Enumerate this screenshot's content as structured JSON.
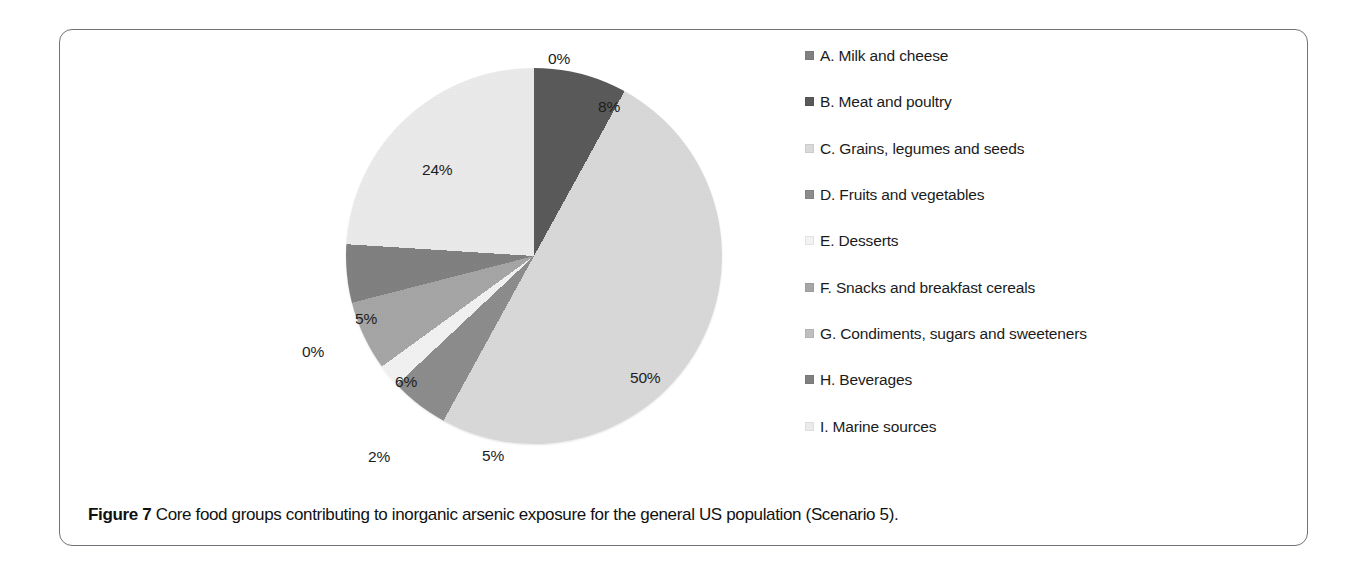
{
  "figure": {
    "caption_label": "Figure 7",
    "caption_text": "Core food groups contributing to inorganic arsenic exposure for the general US population (Scenario 5)."
  },
  "chart_data": {
    "type": "pie",
    "title": "",
    "legend_position": "right",
    "units": "percent",
    "categories": [
      "A. Milk and cheese",
      "B. Meat and poultry",
      "C. Grains, legumes and seeds",
      "D. Fruits and vegetables",
      "E. Desserts",
      "F. Snacks and breakfast cereals",
      "G. Condiments, sugars and sweeteners",
      "H. Beverages",
      "I. Marine sources"
    ],
    "values": [
      0,
      8,
      50,
      5,
      2,
      6,
      0,
      5,
      24
    ],
    "value_labels": [
      "0%",
      "8%",
      "50%",
      "5%",
      "2%",
      "6%",
      "0%",
      "5%",
      "24%"
    ],
    "colors": [
      "#808080",
      "#595959",
      "#d9d9d9",
      "#8c8c8c",
      "#f2f2f2",
      "#a6a6a6",
      "#bfbfbf",
      "#808080",
      "#ebebeb"
    ]
  },
  "legend": {
    "items": [
      {
        "label": "A. Milk and cheese",
        "color": "#808080"
      },
      {
        "label": "B. Meat and poultry",
        "color": "#595959"
      },
      {
        "label": "C. Grains, legumes and seeds",
        "color": "#d9d9d9"
      },
      {
        "label": "D. Fruits and vegetables",
        "color": "#8c8c8c"
      },
      {
        "label": "E. Desserts",
        "color": "#f2f2f2"
      },
      {
        "label": "F. Snacks and breakfast cereals",
        "color": "#a6a6a6"
      },
      {
        "label": "G. Condiments, sugars and sweeteners",
        "color": "#bfbfbf"
      },
      {
        "label": "H. Beverages",
        "color": "#808080"
      },
      {
        "label": "I. Marine sources",
        "color": "#ebebeb"
      }
    ]
  },
  "pie_labels": [
    {
      "text": "0%",
      "x": 248,
      "y": 10
    },
    {
      "text": "8%",
      "x": 298,
      "y": 58
    },
    {
      "text": "50%",
      "x": 330,
      "y": 329
    },
    {
      "text": "5%",
      "x": 182,
      "y": 407
    },
    {
      "text": "2%",
      "x": 68,
      "y": 408
    },
    {
      "text": "6%",
      "x": 95,
      "y": 333
    },
    {
      "text": "0%",
      "x": 2,
      "y": 303
    },
    {
      "text": "5%",
      "x": 55,
      "y": 270
    },
    {
      "text": "24%",
      "x": 122,
      "y": 121
    }
  ]
}
